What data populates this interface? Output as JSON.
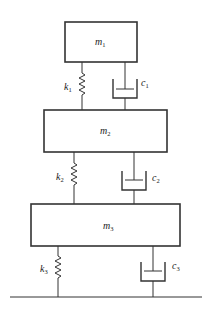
{
  "diagram": {
    "masses": [
      {
        "id": "m1",
        "symbol": "m",
        "sub": "1",
        "x": 65,
        "y": 22,
        "w": 72,
        "h": 40
      },
      {
        "id": "m2",
        "symbol": "m",
        "sub": "2",
        "x": 44,
        "y": 110,
        "w": 123,
        "h": 42
      },
      {
        "id": "m3",
        "symbol": "m",
        "sub": "3",
        "x": 31,
        "y": 204,
        "w": 149,
        "h": 42
      }
    ],
    "springs": [
      {
        "id": "k1",
        "symbol": "k",
        "sub": "1",
        "x": 82,
        "y1": 62,
        "y2": 110
      },
      {
        "id": "k2",
        "symbol": "k",
        "sub": "2",
        "x": 74,
        "y1": 152,
        "y2": 204
      },
      {
        "id": "k3",
        "symbol": "k",
        "sub": "3",
        "x": 58,
        "y1": 246,
        "y2": 297
      }
    ],
    "dampers": [
      {
        "id": "c1",
        "symbol": "c",
        "sub": "1",
        "x": 125,
        "y1": 62,
        "y2": 110
      },
      {
        "id": "c2",
        "symbol": "c",
        "sub": "2",
        "x": 134,
        "y1": 152,
        "y2": 204
      },
      {
        "id": "c3",
        "symbol": "c",
        "sub": "3",
        "x": 153,
        "y1": 246,
        "y2": 297
      }
    ],
    "ground": {
      "x1": 10,
      "x2": 202,
      "y": 297
    }
  }
}
